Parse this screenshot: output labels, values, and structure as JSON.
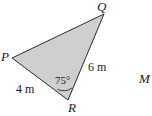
{
  "figure": {
    "shape": "triangle",
    "fill_color": "#cfcfcf",
    "stroke_color": "#2a2a2a",
    "vertices": {
      "P": {
        "label": "P",
        "x": 12,
        "y": 58
      },
      "Q": {
        "label": "Q",
        "x": 104,
        "y": 14
      },
      "R": {
        "label": "R",
        "x": 68,
        "y": 100
      }
    },
    "sides": {
      "PR": {
        "label": "4 m"
      },
      "QR": {
        "label": "6 m"
      }
    },
    "angle_R": {
      "label": "75°"
    },
    "external_point": {
      "label": "M"
    }
  }
}
